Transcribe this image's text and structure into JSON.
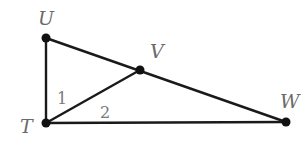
{
  "diagram": {
    "type": "geometry-triangle",
    "points": [
      {
        "name": "U",
        "x": 46,
        "y": 38,
        "label_x": 38,
        "label_y": 25
      },
      {
        "name": "V",
        "x": 140,
        "y": 70,
        "label_x": 150,
        "label_y": 58
      },
      {
        "name": "W",
        "x": 286,
        "y": 122,
        "label_x": 280,
        "label_y": 108
      },
      {
        "name": "T",
        "x": 46,
        "y": 123,
        "label_x": 20,
        "label_y": 133
      }
    ],
    "segments": [
      {
        "from": "U",
        "to": "T"
      },
      {
        "from": "T",
        "to": "W"
      },
      {
        "from": "U",
        "to": "V"
      },
      {
        "from": "V",
        "to": "W"
      },
      {
        "from": "T",
        "to": "V"
      }
    ],
    "angle_labels": [
      {
        "text": "1",
        "x": 57,
        "y": 104
      },
      {
        "text": "2",
        "x": 100,
        "y": 118
      }
    ],
    "colors": {
      "line": "#1a1a1a",
      "point": "#111111",
      "label": "#6a6a6a"
    }
  }
}
